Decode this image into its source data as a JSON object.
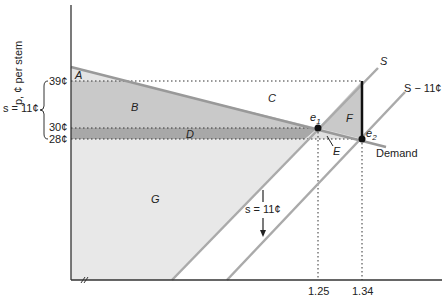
{
  "diagram": {
    "y_axis_label": "p, ¢ per stem",
    "y_ticks": [
      {
        "label": "39¢",
        "value": 39
      },
      {
        "label": "30¢",
        "value": 30
      },
      {
        "label": "28¢",
        "value": 28
      }
    ],
    "x_ticks": [
      {
        "label": "1.25",
        "value": 1.25
      },
      {
        "label": "1.34",
        "value": 1.34
      }
    ],
    "subsidy_brace_label": "s = 11¢",
    "shift_label": "s = 11¢",
    "curves": {
      "supply": "S",
      "supply_shifted": "S − 11¢",
      "demand": "Demand"
    },
    "equilibria": {
      "e1": {
        "label": "e",
        "sub": "1",
        "quantity": 1.25,
        "price": 30
      },
      "e2": {
        "label": "e",
        "sub": "2",
        "quantity": 1.34,
        "price": 28
      }
    },
    "areas": [
      "A",
      "B",
      "C",
      "D",
      "E",
      "F",
      "G"
    ],
    "colors": {
      "area_light": "#e6e6e6",
      "area_medium": "#c8c8c8",
      "area_dark": "#a9a9a9",
      "curve": "#9a9a9a",
      "axis": "#333333"
    }
  }
}
